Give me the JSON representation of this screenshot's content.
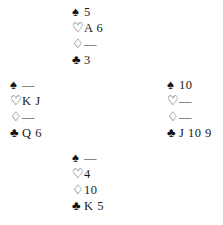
{
  "suit_symbols": {
    "spades": "♠",
    "hearts": "♡",
    "diamonds": "♢",
    "clubs": "♣"
  },
  "hands": {
    "north": {
      "spades": "5",
      "hearts": "A 6",
      "diamonds": "—",
      "clubs": "3"
    },
    "west": {
      "spades": "—",
      "hearts": "K J",
      "diamonds": "—",
      "clubs": "Q 6"
    },
    "east": {
      "spades": "10",
      "hearts": "—",
      "diamonds": "—",
      "clubs": "J 10 9"
    },
    "south": {
      "spades": "—",
      "hearts": "4",
      "diamonds": "10",
      "clubs": "K 5"
    }
  }
}
